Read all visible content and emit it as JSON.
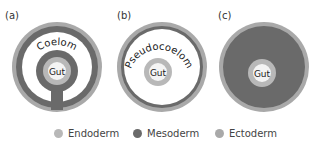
{
  "panels": [
    {
      "label": "(a)",
      "cavity": "Coelom",
      "gut": "Gut"
    },
    {
      "label": "(b)",
      "cavity": "Pseudocoelom",
      "gut": "Gut"
    },
    {
      "label": "(c)",
      "cavity": "",
      "gut": "Gut"
    }
  ],
  "legend": [
    {
      "label": "Endoderm",
      "color": "#b8b8b8"
    },
    {
      "label": "Mesoderm",
      "color": "#6a6a6a"
    },
    {
      "label": "Ectoderm",
      "color": "#a9a9a9"
    }
  ],
  "colors": {
    "endoderm": "#b8b8b8",
    "mesoderm": "#6a6a6a",
    "ectoderm": "#a9a9a9",
    "gut_lumen": "#f4f4f4",
    "cavity": "#ffffff"
  }
}
